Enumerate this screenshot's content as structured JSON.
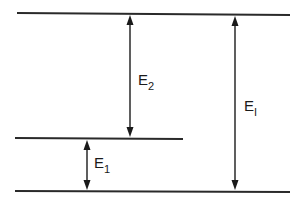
{
  "diagram": {
    "title": "",
    "type": "energy-level-diagram",
    "levels": [
      {
        "name": "upper-level",
        "x1": 17,
        "y1": 13,
        "x2": 290,
        "y2": 15
      },
      {
        "name": "middle-level",
        "x1": 15,
        "y1": 138,
        "x2": 183,
        "y2": 139
      },
      {
        "name": "ground-level",
        "x1": 15,
        "y1": 191,
        "x2": 290,
        "y2": 192
      }
    ],
    "arrows": [
      {
        "name": "e2-arrow",
        "x": 130,
        "y1": 15,
        "y2": 137,
        "label": {
          "main": "E",
          "sub": "2",
          "x": 138,
          "y": 85
        }
      },
      {
        "name": "e1-arrow",
        "x": 87,
        "y1": 140,
        "y2": 190,
        "label": {
          "main": "E",
          "sub": "1",
          "x": 94,
          "y": 168
        }
      },
      {
        "name": "ei-arrow",
        "x": 235,
        "y1": 16,
        "y2": 190,
        "label": {
          "main": "E",
          "sub": "I",
          "x": 244,
          "y": 111
        }
      }
    ],
    "colors": {
      "line": "#2a2a2a",
      "arrow": "#1a1a1a",
      "background": "#ffffff"
    }
  }
}
